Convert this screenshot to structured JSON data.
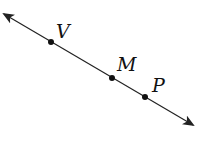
{
  "diagram": {
    "type": "geometry-line",
    "line": {
      "start": [
        4,
        14
      ],
      "end": [
        193,
        125
      ],
      "color": "#222222",
      "arrows": "both"
    },
    "points": [
      {
        "label": "V",
        "x": 51,
        "y": 42,
        "label_x": 56,
        "label_y": 38
      },
      {
        "label": "M",
        "x": 112,
        "y": 78,
        "label_x": 117,
        "label_y": 71
      },
      {
        "label": "P",
        "x": 145,
        "y": 97,
        "label_x": 152,
        "label_y": 92
      }
    ]
  }
}
